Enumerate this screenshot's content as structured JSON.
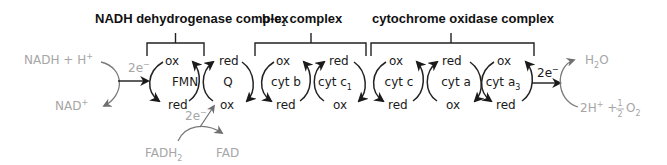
{
  "complexes": [
    {
      "title": "NADH dehydrogenase complex"
    },
    {
      "title_main": "b-c",
      "title_sub": "1",
      "title_rest": " complex"
    },
    {
      "title": "cytochrome oxidase complex"
    }
  ],
  "carriers": [
    {
      "name": "FMN",
      "top": "ox",
      "bottom": "red"
    },
    {
      "name": "Q",
      "top": "red",
      "bottom": "ox"
    },
    {
      "name": "cyt b",
      "top": "ox",
      "bottom": "red"
    },
    {
      "name_main": "cyt c",
      "name_sub": "1",
      "top": "red",
      "bottom": "ox"
    },
    {
      "name": "cyt c",
      "top": "ox",
      "bottom": "red"
    },
    {
      "name": "cyt a",
      "top": "red",
      "bottom": "ox"
    },
    {
      "name_main": "cyt a",
      "name_sub": "3",
      "top": "ox",
      "bottom": "red"
    }
  ],
  "inputs": {
    "nadh": {
      "main": "NADH + H",
      "sup": "+"
    },
    "nad": {
      "main": "NAD",
      "sup": "+"
    },
    "fadh2": {
      "main": "FADH",
      "sub": "2"
    },
    "fad": "FAD",
    "electrons": {
      "main": "2e",
      "sup": "−"
    }
  },
  "outputs": {
    "water": {
      "main": "H",
      "sub": "2",
      "rest": "O"
    },
    "oxygen": {
      "pre": "2H",
      "sup": "+",
      "plus": " + ",
      "num": "1",
      "den": "2",
      "o": "O",
      "sub": "2"
    }
  },
  "colors": {
    "ink": "#1a1a1a",
    "faded": "#a6a6a6"
  }
}
